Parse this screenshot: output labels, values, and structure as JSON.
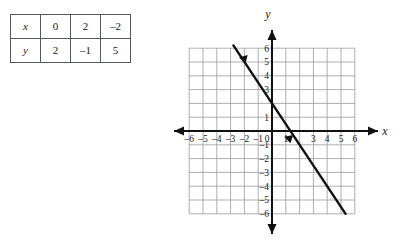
{
  "table": {
    "rows": [
      {
        "header": "x",
        "cells": [
          "0",
          "2",
          "–2"
        ]
      },
      {
        "header": "y",
        "cells": [
          "2",
          "–1",
          "5"
        ]
      }
    ]
  },
  "graph": {
    "x_axis_name": "x",
    "y_axis_name": "y",
    "origin_label": "0",
    "x_ticks": [
      "–6",
      "–5",
      "–4",
      "–3",
      "–2",
      "–1",
      "1",
      "3",
      "4",
      "5",
      "6"
    ],
    "y_ticks": [
      "6",
      "5",
      "4",
      "3",
      "1",
      "–1",
      "–2",
      "–3",
      "–4",
      "–5",
      "–6"
    ],
    "grid_color": "#9a9a9a",
    "axis_color": "#111111",
    "line_color": "#111111"
  },
  "chart_data": {
    "type": "line",
    "title": "",
    "xlabel": "x",
    "ylabel": "y",
    "xlim": [
      -6,
      6
    ],
    "ylim": [
      -6,
      6
    ],
    "grid": true,
    "legend": "none",
    "equation": "y = -1.5x + 2",
    "slope": -1.5,
    "y_intercept": 2,
    "x_intercept": 1.3333,
    "x_tick_values": [
      -6,
      -5,
      -4,
      -3,
      -2,
      -1,
      0,
      1,
      2,
      3,
      4,
      5,
      6
    ],
    "y_tick_values": [
      -6,
      -5,
      -4,
      -3,
      -2,
      -1,
      0,
      1,
      2,
      3,
      4,
      5,
      6
    ],
    "x_tick_labels": [
      "-6",
      "-5",
      "-4",
      "-3",
      "-2",
      "-1",
      "0",
      "1",
      "",
      "3",
      "4",
      "5",
      "6"
    ],
    "y_tick_labels": [
      "-6",
      "-5",
      "-4",
      "-3",
      "-2",
      "-1",
      "0",
      "1",
      "",
      "3",
      "4",
      "5",
      "6"
    ],
    "series": [
      {
        "name": "y = -1.5x + 2",
        "x": [
          -2.8,
          5.33
        ],
        "y": [
          6.2,
          -6.0
        ],
        "table_points": [
          {
            "x": 0,
            "y": 2
          },
          {
            "x": 2,
            "y": -1
          },
          {
            "x": -2,
            "y": 5
          }
        ],
        "arrow_markers": [
          {
            "x": -1.85,
            "y": 4.78
          },
          {
            "x": 1.33,
            "y": -1.0
          }
        ]
      }
    ],
    "table": {
      "row_headers": [
        "x",
        "y"
      ],
      "x": [
        0,
        2,
        -2
      ],
      "y": [
        2,
        -1,
        5
      ]
    }
  }
}
